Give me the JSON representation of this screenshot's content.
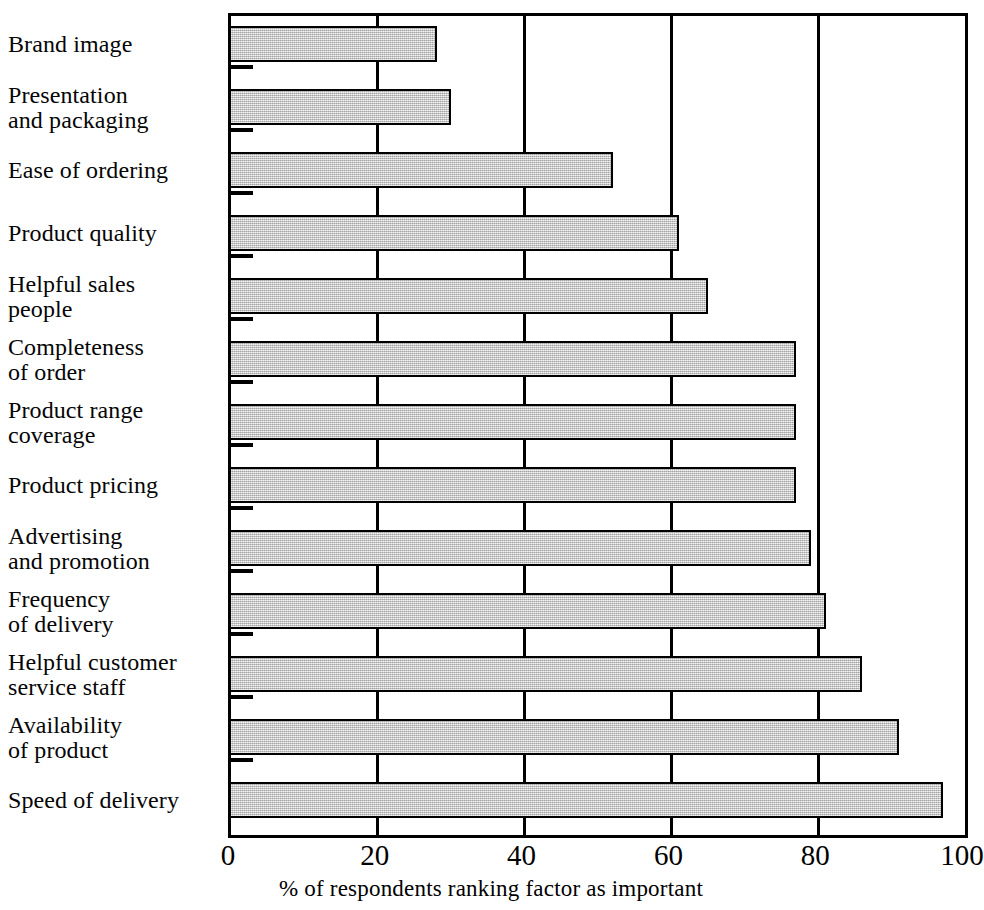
{
  "chart_data": {
    "type": "bar",
    "orientation": "horizontal",
    "title": "",
    "subtitle": "",
    "xlabel": "% of respondents ranking factor as important",
    "ylabel": "",
    "xlim": [
      0,
      100
    ],
    "xticks": [
      0,
      20,
      40,
      60,
      80,
      100
    ],
    "xtick_labels": [
      "0",
      "20",
      "40",
      "60",
      "80",
      "100"
    ],
    "grid": true,
    "grid_axis": "x",
    "legend": null,
    "bar_fill_color": "#c6c6c6",
    "bar_edge_color": "#000000",
    "axis_color": "#000000",
    "background_color": "#ffffff",
    "categories": [
      "Brand image",
      "Presentation\nand packaging",
      "Ease of ordering",
      "Product quality",
      "Helpful sales\npeople",
      "Completeness\nof order",
      "Product range\ncoverage",
      "Product pricing",
      "Advertising\nand promotion",
      "Frequency\nof delivery",
      "Helpful customer\nservice staff",
      "Availability\nof product",
      "Speed of delivery"
    ],
    "values": [
      28,
      30,
      52,
      61,
      65,
      77,
      77,
      77,
      79,
      81,
      86,
      91,
      97
    ],
    "units": "%"
  },
  "axis": {
    "x_title": "% of respondents ranking factor as important"
  }
}
